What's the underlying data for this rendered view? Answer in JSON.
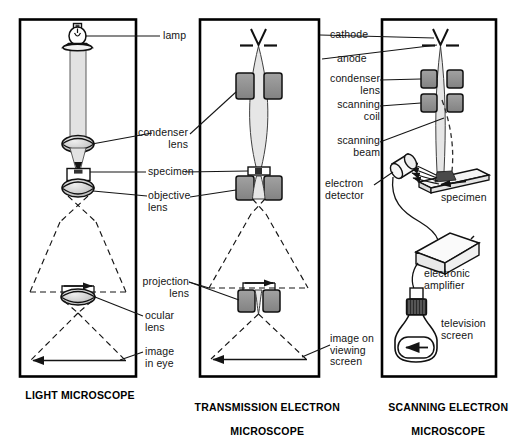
{
  "figure": {
    "kind": "comparison-diagram",
    "panels": [
      {
        "id": "light-microscope",
        "title": "LIGHT MICROSCOPE",
        "components": [
          "lamp",
          "condenser lens",
          "specimen",
          "objective lens",
          "projection lens",
          "ocular lens",
          "image in eye"
        ]
      },
      {
        "id": "transmission-electron-microscope",
        "title": "TRANSMISSION ELECTRON\nMICROSCOPE",
        "components": [
          "cathode",
          "anode",
          "condenser lens",
          "specimen",
          "objective lens",
          "projection lens",
          "image on viewing screen"
        ]
      },
      {
        "id": "scanning-electron-microscope",
        "title": "SCANNING ELECTRON\nMICROSCOPE",
        "components": [
          "cathode",
          "anode",
          "condenser lens",
          "scanning coil",
          "scanning beam",
          "electron detector",
          "specimen",
          "electronic amplifier",
          "television screen"
        ]
      }
    ]
  },
  "labels": {
    "lamp": "lamp",
    "condenser_lens": "condenser\nlens",
    "specimen": "specimen",
    "objective_lens": "objective\nlens",
    "projection_lens": "projection\nlens",
    "ocular_lens": "ocular\nlens",
    "image_in_eye": "image\nin eye",
    "cathode": "cathode",
    "anode": "anode",
    "condenser_lens_r": "condenser\nlens",
    "scanning_coil": "scanning\ncoil",
    "scanning_beam": "scanning\nbeam",
    "electron_detector": "electron\ndetector",
    "specimen_sem": "specimen",
    "electronic_amplifier": "electronic\namplifier",
    "television_screen": "television\nscreen",
    "image_on_viewing_screen": "image on\nviewing\nscreen"
  },
  "titles": {
    "light": "LIGHT MICROSCOPE",
    "tem_line1": "TRANSMISSION ELECTRON",
    "tem_line2": "MICROSCOPE",
    "sem_line1": "SCANNING ELECTRON",
    "sem_line2": "MICROSCOPE"
  },
  "colors": {
    "background": "#ffffff",
    "ink": "#141414",
    "frame": "#000000",
    "lens_fill": "#c9c9c9",
    "coil_fill": "#8f8f8f",
    "beam_fill": "#d8d8d8",
    "specimen_fill": "#3a3a3a"
  }
}
